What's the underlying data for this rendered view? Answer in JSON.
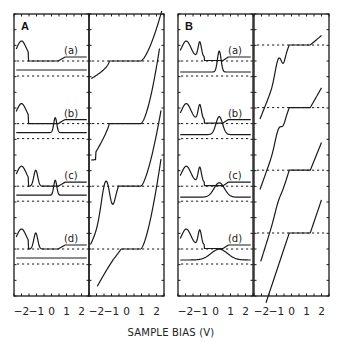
{
  "figure": {
    "xlabel": "SAMPLE BIAS (V)",
    "x_tick_labels": [
      "−2",
      "−1",
      "0",
      "1",
      "2"
    ],
    "x_range": [
      -2.5,
      2.5
    ],
    "colors": {
      "line": "#1a1a1a",
      "frame": "#1a1a1a",
      "background": "#ffffff"
    }
  },
  "panels": [
    {
      "id": "A",
      "label": "A",
      "spectra": [
        {
          "label": "(a)",
          "description": "broad peak near -2 V; featureless lower trace"
        },
        {
          "label": "(b)",
          "description": "broad peak near -2 V; lower trace with sharp peak near 0.3 V"
        },
        {
          "label": "(c)",
          "description": "peaks near -2 V and -1 V; lower trace sharp peak near 0.3 V"
        },
        {
          "label": "(d)",
          "description": "peaks near -2 V and -1 V; featureless lower trace"
        }
      ],
      "iv_curves": 4
    },
    {
      "id": "B",
      "label": "B",
      "spectra": [
        {
          "label": "(a)",
          "description": "peaks near -2 V and -1 V; lower trace sharp peak near 0.3 V"
        },
        {
          "label": "(b)",
          "description": "peaks near -2 V and -1 V; lower trace broadened peak near 0.3 V"
        },
        {
          "label": "(c)",
          "description": "peaks near -2 V and -1 V; lower trace broad peak near 0.3 V"
        },
        {
          "label": "(d)",
          "description": "peaks near -2 V and -1 V; lower trace very broad peak near 0.3 V"
        }
      ],
      "iv_curves": 4
    }
  ],
  "chart_data": [
    {
      "type": "line",
      "title": "A (left): spectra",
      "xlabel": "SAMPLE BIAS (V)",
      "x_ticks": [
        -2,
        -1,
        0,
        1,
        2
      ],
      "series_labels": [
        "(a)",
        "(b)",
        "(c)",
        "(d)"
      ],
      "grid": false
    },
    {
      "type": "line",
      "title": "A (right): I-V staircase",
      "xlabel": "SAMPLE BIAS (V)",
      "x_ticks": [
        -2,
        -1,
        0,
        1,
        2
      ],
      "plateau_range_V": [
        -1.1,
        0.9
      ],
      "grid": false
    },
    {
      "type": "line",
      "title": "B (left): spectra",
      "xlabel": "SAMPLE BIAS (V)",
      "x_ticks": [
        -2,
        -1,
        0,
        1,
        2
      ],
      "series_labels": [
        "(a)",
        "(b)",
        "(c)",
        "(d)"
      ],
      "grid": false
    },
    {
      "type": "line",
      "title": "B (right): I-V staircase",
      "xlabel": "SAMPLE BIAS (V)",
      "x_ticks": [
        -2,
        -1,
        0,
        1,
        2
      ],
      "plateau_range_V": [
        -0.2,
        1.2
      ],
      "grid": false
    }
  ]
}
